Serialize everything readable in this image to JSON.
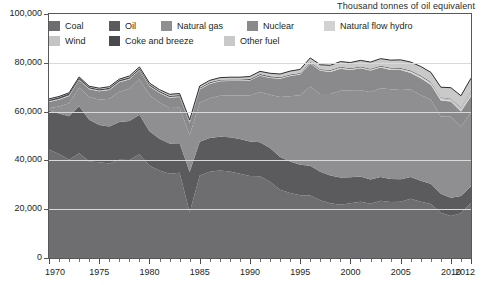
{
  "unit_title": "Thousand tonnes of oil equivalent",
  "legend": {
    "rows": [
      [
        {
          "label": "Coal",
          "color": "#6e6e70",
          "left": 0
        },
        {
          "label": "Oil",
          "color": "#5b5b5d",
          "left": 60
        },
        {
          "label": "Natural gas",
          "color": "#8f8f91",
          "left": 112
        },
        {
          "label": "Nuclear",
          "color": "#8a8a8c",
          "left": 198
        },
        {
          "label": "Natural flow hydro",
          "color": "#d2d2d2",
          "left": 275
        }
      ],
      [
        {
          "label": "Wind",
          "color": "#c4c4c4",
          "left": 0
        },
        {
          "label": "Coke and breeze",
          "color": "#4a4a4c",
          "left": 60
        },
        {
          "label": "Other fuel",
          "color": "#c9c9c9",
          "left": 175
        }
      ]
    ]
  },
  "axis": {
    "y_ticks": [
      "0",
      "20,000",
      "40,000",
      "60,000",
      "80,000",
      "100,000"
    ],
    "y_values": [
      0,
      20000,
      40000,
      60000,
      80000,
      100000
    ],
    "y_min": 0,
    "y_max": 100000,
    "x_major_ticks": [
      "1970",
      "1975",
      "1980",
      "1985",
      "1990",
      "1995",
      "2000",
      "2005",
      "2010",
      "2012"
    ],
    "x_major_values": [
      1970,
      1975,
      1980,
      1985,
      1990,
      1995,
      2000,
      2005,
      2010,
      2012
    ],
    "x_min": 1970,
    "x_max": 2012
  },
  "chart_data": {
    "type": "area",
    "stacked": true,
    "title": "",
    "subtitle": "",
    "xlabel": "",
    "ylabel": "Thousand tonnes of oil equivalent",
    "xlim": [
      1970,
      2012
    ],
    "ylim": [
      0,
      100000
    ],
    "grid": true,
    "legend_position": "top-left-inside",
    "x": [
      1970,
      1971,
      1972,
      1973,
      1974,
      1975,
      1976,
      1977,
      1978,
      1979,
      1980,
      1981,
      1982,
      1983,
      1984,
      1985,
      1986,
      1987,
      1988,
      1989,
      1990,
      1991,
      1992,
      1993,
      1994,
      1995,
      1996,
      1997,
      1998,
      1999,
      2000,
      2001,
      2002,
      2003,
      2004,
      2005,
      2006,
      2007,
      2008,
      2009,
      2010,
      2011,
      2012
    ],
    "series": [
      {
        "name": "Coal",
        "color": "#6e6e70",
        "values": [
          44500,
          42600,
          40300,
          42900,
          39500,
          39200,
          38700,
          40300,
          40200,
          42500,
          37800,
          35900,
          34500,
          34900,
          18600,
          33800,
          35300,
          35900,
          35400,
          34500,
          33600,
          33500,
          31300,
          28000,
          26600,
          25700,
          25600,
          23700,
          22400,
          21800,
          22400,
          23100,
          22200,
          23500,
          23000,
          23100,
          24300,
          23100,
          22100,
          18500,
          17200,
          18300,
          22600
        ]
      },
      {
        "name": "Oil",
        "color": "#5b5b5d",
        "values": [
          15800,
          16600,
          17800,
          19300,
          17200,
          15300,
          15200,
          15400,
          15900,
          16200,
          14100,
          13000,
          12400,
          12100,
          16600,
          13800,
          13900,
          13800,
          14100,
          14300,
          14100,
          13900,
          13800,
          13400,
          13000,
          12500,
          12200,
          11600,
          11400,
          11200,
          10700,
          10300,
          10000,
          9700,
          9400,
          9200,
          8900,
          8600,
          8300,
          7800,
          7500,
          7100,
          6800
        ]
      },
      {
        "name": "Natural gas",
        "color": "#8f8f91",
        "values": [
          1100,
          2900,
          5300,
          7700,
          9300,
          10400,
          11400,
          12400,
          13300,
          14600,
          14900,
          14800,
          14600,
          14600,
          15100,
          16000,
          16300,
          16800,
          17100,
          17800,
          18900,
          20600,
          21800,
          24600,
          26700,
          28500,
          32500,
          31900,
          33400,
          35500,
          35600,
          35400,
          35800,
          36400,
          36800,
          36600,
          35900,
          35100,
          34500,
          31700,
          33200,
          28500,
          30200
        ]
      },
      {
        "name": "Nuclear",
        "color": "#8a8a8c",
        "values": [
          2500,
          2800,
          3000,
          3000,
          3200,
          3400,
          3600,
          3900,
          3800,
          3600,
          3500,
          3900,
          4200,
          4400,
          4900,
          5500,
          5800,
          5900,
          5900,
          5900,
          6100,
          6700,
          6900,
          7500,
          8300,
          8500,
          9400,
          9500,
          9000,
          9100,
          8300,
          9000,
          8800,
          8500,
          7900,
          8100,
          6700,
          6900,
          6100,
          6600,
          6200,
          6100,
          6700
        ]
      },
      {
        "name": "Natural flow hydro",
        "color": "#d2d2d2",
        "values": [
          300,
          300,
          300,
          300,
          300,
          300,
          300,
          300,
          300,
          300,
          300,
          300,
          300,
          300,
          300,
          300,
          300,
          300,
          300,
          300,
          300,
          300,
          300,
          300,
          300,
          300,
          300,
          300,
          400,
          400,
          400,
          300,
          400,
          300,
          400,
          400,
          400,
          400,
          400,
          400,
          300,
          400,
          400
        ]
      },
      {
        "name": "Wind",
        "color": "#c4c4c4",
        "values": [
          0,
          0,
          0,
          0,
          0,
          0,
          0,
          0,
          0,
          0,
          0,
          0,
          0,
          0,
          0,
          0,
          0,
          0,
          0,
          0,
          0,
          0,
          0,
          0,
          0,
          0,
          0,
          100,
          100,
          100,
          100,
          100,
          100,
          100,
          200,
          200,
          300,
          400,
          500,
          700,
          800,
          1200,
          1800
        ]
      },
      {
        "name": "Coke and breeze",
        "color": "#4a4a4c",
        "values": [
          700,
          700,
          700,
          700,
          600,
          600,
          600,
          600,
          600,
          600,
          600,
          500,
          500,
          500,
          400,
          400,
          400,
          400,
          400,
          400,
          400,
          400,
          400,
          300,
          300,
          300,
          300,
          300,
          300,
          300,
          300,
          300,
          300,
          300,
          300,
          300,
          300,
          300,
          300,
          200,
          200,
          200,
          200
        ]
      },
      {
        "name": "Other fuel",
        "color": "#c9c9c9",
        "values": [
          300,
          300,
          300,
          300,
          300,
          400,
          400,
          400,
          500,
          500,
          500,
          600,
          600,
          600,
          700,
          700,
          800,
          800,
          900,
          900,
          1000,
          1100,
          1200,
          1300,
          1400,
          1500,
          1700,
          1800,
          2000,
          2100,
          2300,
          2500,
          2700,
          2900,
          3100,
          3300,
          3500,
          3700,
          3900,
          4100,
          4400,
          4700,
          5000
        ]
      }
    ]
  }
}
